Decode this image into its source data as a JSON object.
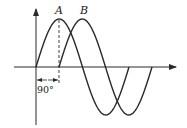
{
  "diagram": {
    "wave_a": {
      "label": "A",
      "start_x": 36,
      "phase_deg": 0
    },
    "wave_b": {
      "label": "B",
      "start_x": 59,
      "phase_deg": 90
    },
    "phase_annotation": {
      "label": "90°"
    },
    "axes": {
      "origin_x": 36,
      "origin_y": 67,
      "amplitude_px": 48,
      "period_px": 93
    },
    "colors": {
      "stroke": "#2a2a2a",
      "background": "#ffffff"
    }
  }
}
